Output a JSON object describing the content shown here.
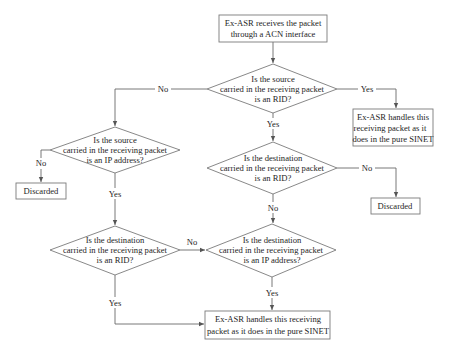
{
  "diagram": {
    "type": "flowchart",
    "nodes": {
      "start": {
        "lines": [
          "Ex-ASR receives the packet",
          "through a ACN interface"
        ]
      },
      "d_src_rid": {
        "lines": [
          "Is the source",
          "carried in the receiving packet",
          "is an RID?"
        ]
      },
      "handle_right": {
        "lines": [
          "Ex-ASR handles this",
          "receiving packet as it",
          "does in the pure SINET"
        ]
      },
      "d_src_ip": {
        "lines": [
          "Is the source",
          "carried in the receiving packet",
          "is an IP address?"
        ]
      },
      "discard_left": {
        "lines": [
          "Discarded"
        ]
      },
      "d_dst_rid_center": {
        "lines": [
          "Is the destination",
          "carried in the receiving packet",
          "is an RID?"
        ]
      },
      "discard_right": {
        "lines": [
          "Discarded"
        ]
      },
      "d_dst_rid_left": {
        "lines": [
          "Is the destination",
          "carried in the receiving packet",
          "is an RID?"
        ]
      },
      "d_dst_ip": {
        "lines": [
          "Is the destination",
          "carried in the receiving packet",
          "is an IP address?"
        ]
      },
      "handle_bottom": {
        "lines": [
          "Ex-ASR handles this receiving",
          "packet as it does in the pure SINET"
        ]
      }
    },
    "edges": [
      {
        "from": "start",
        "to": "d_src_rid",
        "label": ""
      },
      {
        "from": "d_src_rid",
        "to": "handle_right",
        "label": "Yes"
      },
      {
        "from": "d_src_rid",
        "to": "d_src_ip",
        "label": "No"
      },
      {
        "from": "d_src_rid",
        "to": "d_dst_rid_center",
        "label": "Yes"
      },
      {
        "from": "d_src_ip",
        "to": "discard_left",
        "label": "No"
      },
      {
        "from": "d_src_ip",
        "to": "d_dst_rid_left",
        "label": "Yes"
      },
      {
        "from": "d_dst_rid_center",
        "to": "discard_right",
        "label": "No"
      },
      {
        "from": "d_dst_rid_center",
        "to": "d_dst_ip",
        "label": "No"
      },
      {
        "from": "d_dst_rid_left",
        "to": "d_dst_ip",
        "label": "No"
      },
      {
        "from": "d_dst_rid_left",
        "to": "handle_bottom",
        "label": "Yes"
      },
      {
        "from": "d_dst_ip",
        "to": "handle_bottom",
        "label": "Yes"
      }
    ],
    "labels": {
      "yes": "Yes",
      "no": "No"
    },
    "colors": {
      "stroke": "#7a7a7a",
      "edge": "#6a6a6a",
      "text": "#1e1e1e",
      "background": "#ffffff"
    }
  }
}
